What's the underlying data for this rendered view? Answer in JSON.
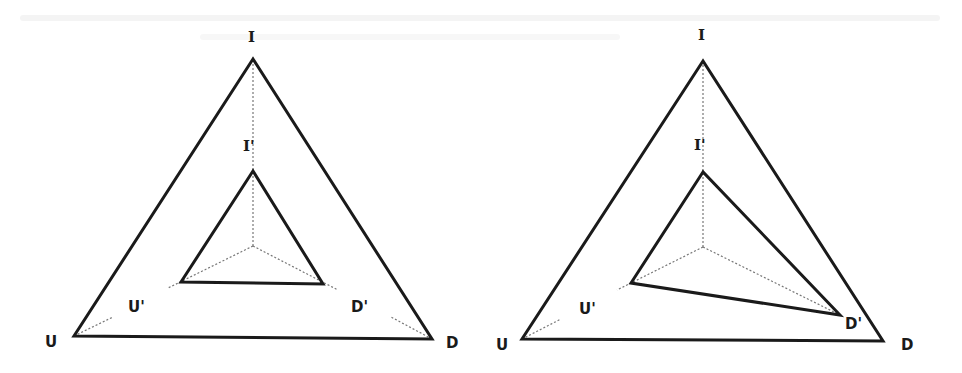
{
  "figure": {
    "colors": {
      "line": "#1a1a1a",
      "dotted": "#777777",
      "background": "#ffffff"
    }
  },
  "left_diagram": {
    "outer": {
      "I": {
        "label": "I",
        "x": 253,
        "y": 59
      },
      "U": {
        "label": "U",
        "x": 74,
        "y": 336
      },
      "D": {
        "label": "D",
        "x": 432,
        "y": 339
      }
    },
    "inner": {
      "I": {
        "label": "I'",
        "x": 253,
        "y": 171
      },
      "U": {
        "label": "U'",
        "x": 181,
        "y": 282
      },
      "D": {
        "label": "D'",
        "x": 323,
        "y": 284
      }
    },
    "center": {
      "x": 253,
      "y": 246
    }
  },
  "right_diagram": {
    "outer": {
      "I": {
        "label": "I",
        "x": 703,
        "y": 61
      },
      "U": {
        "label": "U",
        "x": 522,
        "y": 339
      },
      "D": {
        "label": "D",
        "x": 883,
        "y": 341
      }
    },
    "inner": {
      "I": {
        "label": "I'",
        "x": 703,
        "y": 172
      },
      "U": {
        "label": "U'",
        "x": 631,
        "y": 283
      },
      "D": {
        "label": "D'",
        "x": 840,
        "y": 315
      }
    },
    "center": {
      "x": 703,
      "y": 247
    }
  }
}
